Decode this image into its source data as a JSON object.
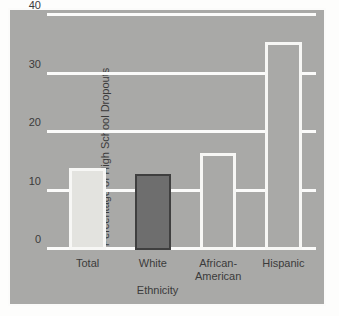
{
  "chart_data": {
    "type": "bar",
    "title": "",
    "xlabel": "Ethnicity",
    "ylabel": "Percentage of High School Dropouts",
    "categories": [
      "Total",
      "White",
      "African-\nAmerican",
      "Hispanic"
    ],
    "values": [
      14,
      13,
      16.5,
      35.5
    ],
    "ylim": [
      0,
      40
    ],
    "yticks": [
      0,
      10,
      20,
      30,
      40
    ],
    "ytick_labels": [
      "0",
      "10",
      "20",
      "30",
      "40"
    ],
    "grid": true,
    "gridline_color": "#fbfbfa",
    "legend": null,
    "legend_position": "none",
    "bar_styles": [
      {
        "category": "Total",
        "fill": "#e3e3df",
        "outline": "#f7f7f5",
        "outline_style": "white"
      },
      {
        "category": "White",
        "fill": "#6e6e6e",
        "outline": "#3f3f3f",
        "outline_style": "dark"
      },
      {
        "category": "African-American",
        "fill": "#a9a9a7",
        "outline": "#f7f7f5",
        "outline_style": "white"
      },
      {
        "category": "Hispanic",
        "fill": "#a9a9a7",
        "outline": "#f7f7f5",
        "outline_style": "white"
      }
    ],
    "panel_background": "#a9a9a7",
    "panel_border": "#fbfbfa",
    "page_background": "#fdfdfc",
    "text_color": "#3b3b3b"
  }
}
